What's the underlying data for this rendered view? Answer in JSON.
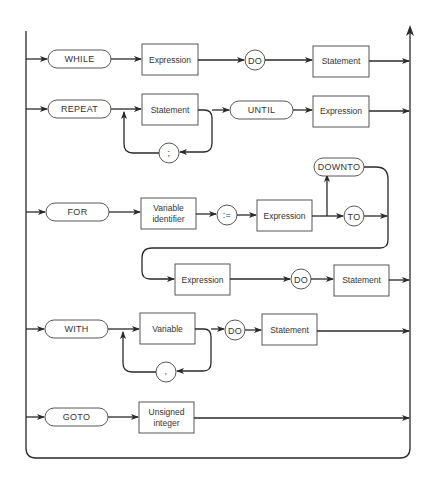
{
  "diagram": {
    "title": "",
    "type": "syntax-diagram",
    "rows": {
      "while": {
        "keyword": "WHILE",
        "expression": "Expression",
        "do": "DO",
        "statement": "Statement"
      },
      "repeat": {
        "keyword": "REPEAT",
        "statement": "Statement",
        "separator": ";",
        "until": "UNTIL",
        "expression": "Expression"
      },
      "for": {
        "keyword": "FOR",
        "variable_line1": "Variable",
        "variable_line2": "identifier",
        "assign": ":=",
        "expression1": "Expression",
        "downto": "DOWNTO",
        "to": "TO",
        "expression2": "Expression",
        "do": "DO",
        "statement": "Statement"
      },
      "with": {
        "keyword": "WITH",
        "variable": "Variable",
        "separator": ",",
        "do": "DO",
        "statement": "Statement"
      },
      "goto": {
        "keyword": "GOTO",
        "label_line1": "Unsigned",
        "label_line2": "integer"
      }
    }
  }
}
